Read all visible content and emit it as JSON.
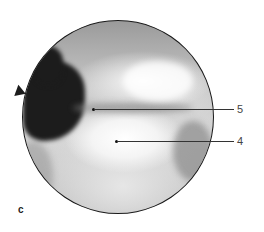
{
  "figure": {
    "type": "arthroscopic-view",
    "panel_label": "c",
    "labels": [
      {
        "id": "5",
        "text": "5"
      },
      {
        "id": "4",
        "text": "4"
      }
    ]
  }
}
